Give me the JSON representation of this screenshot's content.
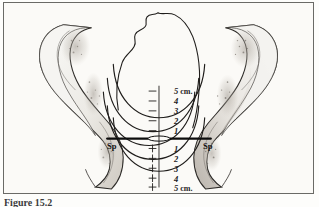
{
  "figure": {
    "caption_visible_fragment": "Figure 15.2",
    "background_color": "#fbfaf7",
    "frame_color": "#6a6a66",
    "ink_color": "#1b1b1b",
    "bone_fill": "#f2f0ec",
    "bone_shade": "#b9b4ad"
  },
  "landmarks": [
    {
      "name": "left-ischial-spine",
      "label": "Sp",
      "side": "left"
    },
    {
      "name": "right-ischial-spine",
      "label": "Sp",
      "side": "right"
    }
  ],
  "interspinous_line": {
    "label": "0",
    "description": "Bold horizontal line joining the ischial spines, station zero"
  },
  "scale": {
    "unit": "cm",
    "unit_label": "cm.",
    "above_spines_sign": "-",
    "below_spines_sign": "+",
    "ticks": [
      {
        "sign": "-",
        "value": "5",
        "unit": "cm.",
        "position": "above"
      },
      {
        "sign": "-",
        "value": "4",
        "unit": "",
        "position": "above"
      },
      {
        "sign": "-",
        "value": "3",
        "unit": "",
        "position": "above"
      },
      {
        "sign": "-",
        "value": "2",
        "unit": "",
        "position": "above"
      },
      {
        "sign": "-",
        "value": "1",
        "unit": "",
        "position": "above"
      },
      {
        "sign": "+",
        "value": "1",
        "unit": "",
        "position": "below"
      },
      {
        "sign": "+",
        "value": "2",
        "unit": "",
        "position": "below"
      },
      {
        "sign": "+",
        "value": "3",
        "unit": "",
        "position": "below"
      },
      {
        "sign": "+",
        "value": "4",
        "unit": "",
        "position": "below"
      },
      {
        "sign": "+",
        "value": "5",
        "unit": "cm.",
        "position": "below"
      }
    ]
  },
  "anatomy": [
    {
      "name": "left-innominate-bone",
      "label": "left iliac / ischial bone"
    },
    {
      "name": "right-innominate-bone",
      "label": "right iliac / ischial bone"
    },
    {
      "name": "fetal-head-outline",
      "label": "fetal head"
    },
    {
      "name": "station-arcs",
      "label": "descent level arcs"
    }
  ]
}
